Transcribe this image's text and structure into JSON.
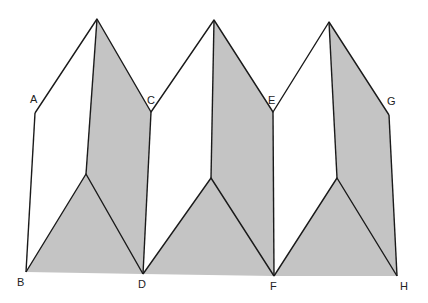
{
  "diagram": {
    "title": "",
    "colors": {
      "shade": "#c4c4c4",
      "line": "#1a1a1a",
      "background": "#ffffff"
    },
    "labels": [
      {
        "id": "A",
        "text": "A",
        "x": 30,
        "y": 103
      },
      {
        "id": "B",
        "text": "B",
        "x": 17,
        "y": 286
      },
      {
        "id": "C",
        "text": "C",
        "x": 147,
        "y": 104
      },
      {
        "id": "D",
        "text": "D",
        "x": 138,
        "y": 288
      },
      {
        "id": "E",
        "text": "E",
        "x": 268,
        "y": 104
      },
      {
        "id": "F",
        "text": "F",
        "x": 270,
        "y": 290
      },
      {
        "id": "G",
        "text": "G",
        "x": 387,
        "y": 105
      },
      {
        "id": "H",
        "text": "H",
        "x": 400,
        "y": 290
      }
    ]
  }
}
